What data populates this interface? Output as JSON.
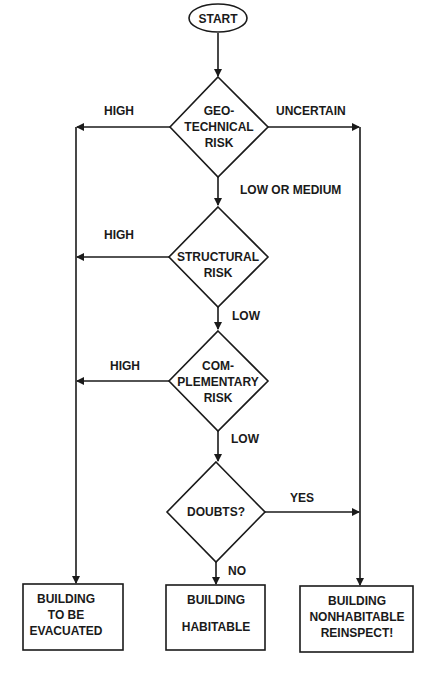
{
  "colors": {
    "ink": "#1a1a1a",
    "background": "#ffffff"
  },
  "nodes": {
    "start": {
      "label": "START"
    },
    "geotechnical": {
      "lines": [
        "GEO-",
        "TECHNICAL",
        "RISK"
      ]
    },
    "structural": {
      "lines": [
        "STRUCTURAL",
        "RISK"
      ]
    },
    "complementary": {
      "lines": [
        "COM-",
        "PLEMENTARY",
        "RISK"
      ]
    },
    "doubts": {
      "lines": [
        "DOUBTS?"
      ]
    },
    "evacuate": {
      "lines": [
        "BUILDING",
        "TO BE",
        "EVACUATED"
      ]
    },
    "habitable": {
      "lines": [
        "BUILDING",
        "HABITABLE"
      ]
    },
    "nonhabitable": {
      "lines": [
        "BUILDING",
        "NONHABITABLE",
        "REINSPECT!"
      ]
    }
  },
  "edges": {
    "geo_high": "HIGH",
    "geo_uncertain": "UNCERTAIN",
    "geo_low_medium": "LOW OR MEDIUM",
    "struct_high": "HIGH",
    "struct_low": "LOW",
    "comp_high": "HIGH",
    "comp_low": "LOW",
    "doubts_yes": "YES",
    "doubts_no": "NO"
  }
}
